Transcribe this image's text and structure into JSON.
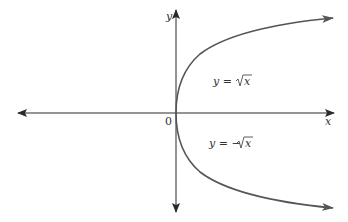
{
  "diagram": {
    "type": "function-graph",
    "axes": {
      "x_label": "x",
      "y_label": "y",
      "origin_label": "0"
    },
    "curves": [
      {
        "name": "upper-branch",
        "equation_lhs": "y =",
        "equation_rhs": "x",
        "radical": true,
        "sign": ""
      },
      {
        "name": "lower-branch",
        "equation_lhs": "y = −",
        "equation_rhs": "x",
        "radical": true,
        "sign": "-"
      }
    ],
    "colors": {
      "axis": "#2a2a2a",
      "curve": "#555555",
      "text": "#333333"
    }
  }
}
